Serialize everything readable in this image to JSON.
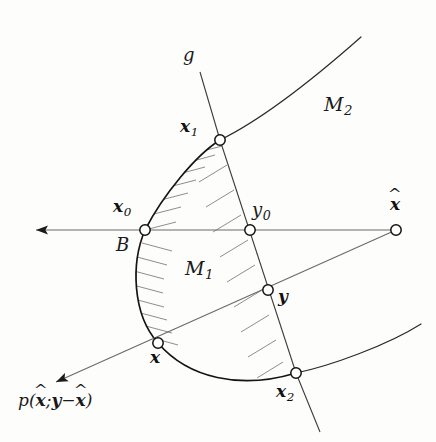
{
  "figure": {
    "colors": {
      "ink": "#111111",
      "line": "#555555",
      "hatch": "#6b6b6b",
      "background": "#fdfdfc",
      "node_fill": "#ffffff"
    },
    "labels": {
      "g": "g",
      "M1": "M",
      "M1_sub": "1",
      "M2": "M",
      "M2_sub": "2",
      "B": "B",
      "x0": "x",
      "x0_sub": "0",
      "x1": "x",
      "x1_sub": "1",
      "x2": "x",
      "x2_sub": "2",
      "y0": "y",
      "y0_sub": "0",
      "y": "y",
      "x": "x",
      "xhat": "x",
      "hat": "^",
      "p_open": "p(",
      "p_xhat": "x",
      "p_semi": ";",
      "p_y": "y",
      "p_minus": "−",
      "p_xhat2": "x",
      "p_close": ")"
    },
    "nodes": [
      {
        "name": "x0",
        "x": 145,
        "y": 230,
        "label": "x₀"
      },
      {
        "name": "x1",
        "x": 220,
        "y": 140,
        "label": "x₁"
      },
      {
        "name": "x2",
        "x": 296,
        "y": 373,
        "label": "x₂"
      },
      {
        "name": "y0",
        "x": 250,
        "y": 230,
        "label": "y₀"
      },
      {
        "name": "y",
        "x": 268,
        "y": 290,
        "label": "y"
      },
      {
        "name": "x",
        "x": 158,
        "y": 343,
        "label": "x"
      },
      {
        "name": "xhat",
        "x": 396,
        "y": 230,
        "label": "x̂"
      }
    ],
    "lines": {
      "horizontal_axis": {
        "from_x": 30,
        "from_y": 230,
        "to_x": 400,
        "to_y": 230,
        "arrow": "left"
      },
      "line_g": {
        "from_x": 200,
        "from_y": 72,
        "to_x": 320,
        "to_y": 432
      },
      "ray_p": {
        "from_x": 396,
        "from_y": 230,
        "to_x": 52,
        "to_y": 384,
        "arrow": "lower-left"
      },
      "boundary_M2_upper": {
        "from_x": 220,
        "from_y": 140,
        "to_x": 360,
        "to_y": 37
      },
      "boundary_M2_lower": {
        "from_x": 296,
        "from_y": 373,
        "to_x": 420,
        "to_y": 325
      }
    }
  }
}
